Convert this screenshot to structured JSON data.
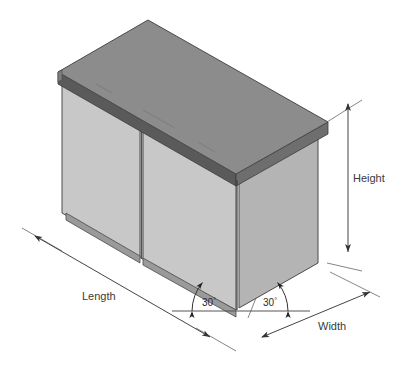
{
  "drawing": {
    "title": "Isometric cabinet dimension diagram",
    "object_name": "two-door base cabinet",
    "projection": "isometric",
    "labels": {
      "length": "Length",
      "width": "Width",
      "height": "Height"
    },
    "angles": [
      {
        "id": "left",
        "value": "30",
        "degree_symbol": "°"
      },
      {
        "id": "right",
        "value": "30",
        "degree_symbol": "°"
      }
    ],
    "colors": {
      "background": "#ffffff",
      "countertop_top": "#8c8c8c",
      "countertop_edge_front": "#5a5a5a",
      "countertop_edge_right": "#6e6e6e",
      "door_face": "#c8c8c8",
      "side_panel": "#b4b4b4",
      "toe_kick": "#9a9a9a",
      "outline": "#4a4a4a",
      "dimension_line": "#555555",
      "text": "#3a3a3a"
    }
  }
}
